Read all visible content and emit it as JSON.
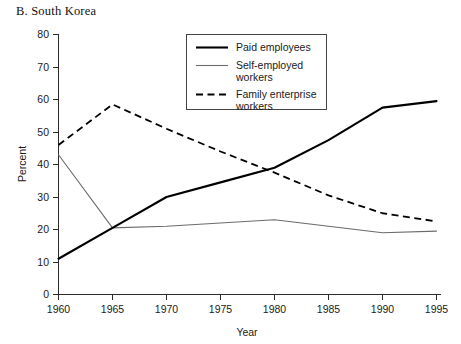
{
  "panel": {
    "title": "B. South Korea"
  },
  "chart_data": {
    "type": "line",
    "title": "B. South Korea",
    "xlabel": "Year",
    "ylabel": "Percent",
    "x": [
      1960,
      1965,
      1970,
      1975,
      1980,
      1985,
      1990,
      1995
    ],
    "xlim": [
      1960,
      1995
    ],
    "ylim": [
      0,
      80
    ],
    "xticks": [
      "1960",
      "1965",
      "1970",
      "1975",
      "1980",
      "1985",
      "1990",
      "1995"
    ],
    "yticks": [
      "0",
      "10",
      "20",
      "30",
      "40",
      "50",
      "60",
      "70",
      "80"
    ],
    "grid": false,
    "legend_position": "top-right-inside",
    "series": [
      {
        "name": "Paid employees",
        "style": "solid-thick",
        "color": "#000000",
        "values": [
          11,
          20.5,
          30,
          34.5,
          39,
          47.5,
          57.5,
          59.5
        ]
      },
      {
        "name": "Self-employed workers",
        "style": "solid-thin",
        "color": "#6b6b6b",
        "values": [
          43,
          20.5,
          21,
          22,
          23,
          21,
          19,
          19.5
        ]
      },
      {
        "name": "Family enterprise workers",
        "style": "dashed",
        "color": "#000000",
        "values": [
          46,
          58.5,
          51,
          44,
          37.5,
          30.5,
          25,
          22.5
        ]
      }
    ]
  },
  "legend": {
    "items": [
      {
        "label_line1": "Paid employees",
        "label_line2": ""
      },
      {
        "label_line1": "Self-employed",
        "label_line2": "workers"
      },
      {
        "label_line1": "Family enterprise",
        "label_line2": "workers"
      }
    ]
  }
}
